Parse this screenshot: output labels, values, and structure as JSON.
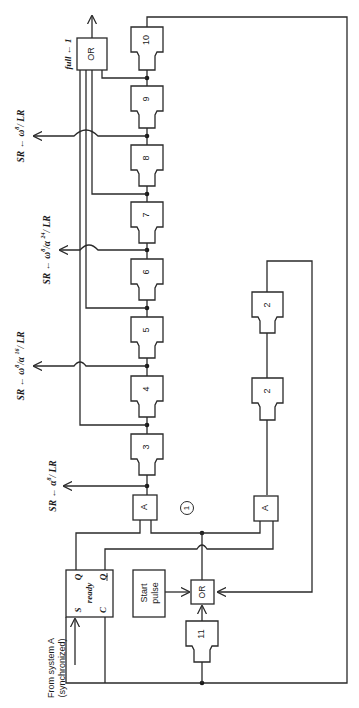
{
  "diagram": {
    "orientation": "rotated-90-ccw",
    "delay_blocks": [
      {
        "label": "10",
        "y": 27
      },
      {
        "label": "9",
        "y": 86
      },
      {
        "label": "8",
        "y": 145
      },
      {
        "label": "7",
        "y": 202
      },
      {
        "label": "6",
        "y": 259
      },
      {
        "label": "5",
        "y": 317
      },
      {
        "label": "4",
        "y": 376
      },
      {
        "label": "3",
        "y": 434
      }
    ],
    "loop_blocks": [
      {
        "label": "2",
        "y": 292
      },
      {
        "label": "2",
        "y": 378
      }
    ],
    "block_11": {
      "label": "11"
    },
    "and_gates": [
      {
        "label": "A",
        "name": "and-gate-main"
      },
      {
        "label": "A",
        "name": "and-gate-loop"
      }
    ],
    "or_gates": {
      "top": "OR",
      "bottom": "OR"
    },
    "start_pulse": {
      "line1": "Start",
      "line2": "pulse"
    },
    "latch": {
      "name": "ready",
      "S": "S",
      "Q": "Q",
      "C": "C",
      "Qbar": "Q"
    },
    "input_label": {
      "line1": "From system A",
      "line2": "(synchronized)"
    },
    "circle_marker": "1",
    "output_labels": {
      "full": "full ← 1",
      "omega8": {
        "left": "SR ← ",
        "expr": "ω",
        "sup": "8",
        "tail": "/ LR"
      },
      "omega8_alpha24": {
        "left": "SR ← ",
        "expr": "ω",
        "sup": "8",
        "mid": "/α ",
        "sup2": "24",
        "tail": "/ LR"
      },
      "omega8_alpha16": {
        "left": "SR ← ",
        "expr": "ω",
        "sup": "8",
        "mid": "/α ",
        "sup2": "16",
        "tail": "/ LR"
      },
      "alpha8": {
        "left": "SR ← ",
        "expr": "α",
        "sup": "8",
        "tail": "/ LR"
      }
    }
  }
}
